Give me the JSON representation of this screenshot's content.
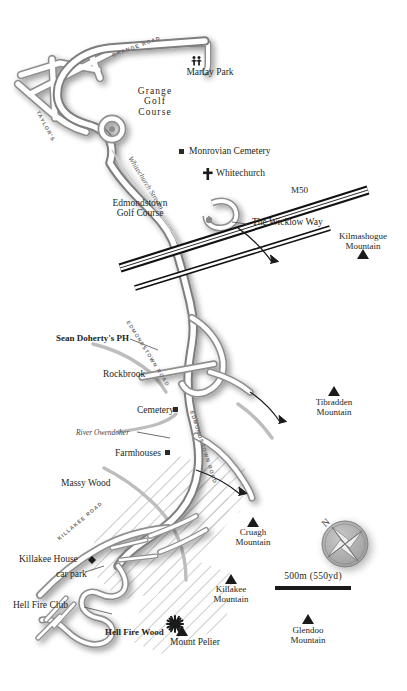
{
  "map": {
    "title": "Hell Fire Club / Dublin Mountains area map",
    "background_color": "#ffffff",
    "ink_color": "#231f20",
    "road_fill": "#ffffff",
    "road_casing": "#8a8a8a",
    "minor_road_color": "#b9b9b9",
    "motorway_color": "#111111"
  },
  "places": [
    {
      "name": "Marlay Park",
      "label": "Marlay Park",
      "x": 210,
      "y": 73,
      "align": "center",
      "style": "regular",
      "size": 9.5
    },
    {
      "name": "Grange Golf Course",
      "label_lines": [
        "Grange",
        "Golf",
        "Course"
      ],
      "x": 155,
      "y": 92,
      "align": "center",
      "style": "regular",
      "size": 9.5
    },
    {
      "name": "Monrovian Cemetery",
      "label": "Monrovian Cemetery",
      "x": 190,
      "y": 152,
      "align": "left",
      "style": "regular",
      "size": 9.5
    },
    {
      "name": "Whitechurch",
      "label": "Whitechurch",
      "x": 215,
      "y": 174,
      "align": "left",
      "style": "regular",
      "size": 9.5
    },
    {
      "name": "Whitechurch Stream",
      "label": "Whitechurch Stream",
      "x": 140,
      "y": 168,
      "align": "left",
      "style": "italic",
      "size": 7.5
    },
    {
      "name": "Edmondstown Golf Course",
      "label_lines": [
        "Edmondstown",
        "Golf Course"
      ],
      "x": 140,
      "y": 203,
      "align": "center",
      "style": "regular",
      "size": 9.5
    },
    {
      "name": "M50",
      "label": "M50",
      "x": 292,
      "y": 192,
      "align": "left",
      "style": "regular",
      "size": 9
    },
    {
      "name": "The Wicklow Way",
      "label": "The Wicklow Way",
      "x": 253,
      "y": 223,
      "align": "left",
      "style": "regular",
      "size": 9.5
    },
    {
      "name": "Kilmashogue Mountain",
      "label_lines": [
        "Kilmashogue",
        "Mountain"
      ],
      "x": 363,
      "y": 238,
      "align": "center",
      "style": "regular",
      "size": 9
    },
    {
      "name": "Sean Doherty's PH",
      "label": "Sean Doherty's PH",
      "x": 57,
      "y": 340,
      "align": "left",
      "style": "bold",
      "size": 9
    },
    {
      "name": "Rockbrook",
      "label": "Rockbrook",
      "x": 104,
      "y": 375,
      "align": "left",
      "style": "regular",
      "size": 9.5
    },
    {
      "name": "Cemetery",
      "label": "Cemetery",
      "x": 138,
      "y": 412,
      "align": "left",
      "style": "regular",
      "size": 9.5
    },
    {
      "name": "River Owendoher",
      "label": "River Owendoher",
      "x": 77,
      "y": 434,
      "align": "left",
      "style": "italic",
      "size": 7.5
    },
    {
      "name": "Farmhouses",
      "label": "Farmhouses",
      "x": 116,
      "y": 455,
      "align": "left",
      "style": "regular",
      "size": 9.5
    },
    {
      "name": "Massy Wood",
      "label": "Massy Wood",
      "x": 62,
      "y": 484,
      "align": "left",
      "style": "regular",
      "size": 9.5
    },
    {
      "name": "Tibradden Mountain",
      "label_lines": [
        "Tibradden",
        "Mountain"
      ],
      "x": 334,
      "y": 404,
      "align": "center",
      "style": "regular",
      "size": 9
    },
    {
      "name": "Cruagh Mountain",
      "label_lines": [
        "Cruagh",
        "Mountain"
      ],
      "x": 253,
      "y": 534,
      "align": "center",
      "style": "regular",
      "size": 9
    },
    {
      "name": "Killakee House",
      "label": "Killakee House",
      "x": 20,
      "y": 561,
      "align": "left",
      "style": "regular",
      "size": 9.5
    },
    {
      "name": "car park",
      "label": "car park",
      "x": 57,
      "y": 575,
      "align": "left",
      "style": "regular",
      "size": 9.5
    },
    {
      "name": "Killakee Mountain",
      "label_lines": [
        "Killakee",
        "Mountain"
      ],
      "x": 231,
      "y": 591,
      "align": "center",
      "style": "regular",
      "size": 9
    },
    {
      "name": "Hell Fire Club",
      "label": "Hell Fire Club",
      "x": 14,
      "y": 606,
      "align": "left",
      "style": "regular",
      "size": 9.5
    },
    {
      "name": "Hell Fire Wood",
      "label": "Hell Fire Wood",
      "x": 106,
      "y": 634,
      "align": "left",
      "style": "bold",
      "size": 9
    },
    {
      "name": "Mount Pelier",
      "label": "Mount Pelier",
      "x": 171,
      "y": 643,
      "align": "left",
      "style": "regular",
      "size": 9.5
    },
    {
      "name": "Glendoo Mountain",
      "label_lines": [
        "Glendoo",
        "Mountain"
      ],
      "x": 308,
      "y": 632,
      "align": "center",
      "style": "regular",
      "size": 9
    }
  ],
  "road_labels": [
    {
      "name": "grange-road",
      "text": "GRANGE ROAD",
      "x": 112,
      "y": 52,
      "rotate": -20
    },
    {
      "name": "taylors-lane",
      "text": "TAYLOR'S",
      "x": 38,
      "y": 108,
      "rotate": 62
    },
    {
      "name": "edmondstown-road-upper",
      "text": "EDMONDSTOWN ROAD",
      "x": 128,
      "y": 318,
      "rotate": 58
    },
    {
      "name": "edmondstown-road-lower",
      "text": "EDMONDSTOWN ROAD",
      "x": 192,
      "y": 408,
      "rotate": 72
    },
    {
      "name": "killakee-road",
      "text": "KILLAKEE ROAD",
      "x": 58,
      "y": 530,
      "rotate": 40
    }
  ],
  "markers": {
    "mountain_peaks": [
      {
        "name": "kilmashogue-peak",
        "x": 363,
        "y": 256
      },
      {
        "name": "tibradden-peak",
        "x": 334,
        "y": 393
      },
      {
        "name": "cruagh-peak",
        "x": 253,
        "y": 524
      },
      {
        "name": "killakee-peak",
        "x": 231,
        "y": 581
      },
      {
        "name": "glendoo-peak",
        "x": 308,
        "y": 621
      },
      {
        "name": "mount-pelier-peak",
        "x": 182,
        "y": 633
      }
    ],
    "squares": [
      {
        "name": "monrovian-cemetery-marker",
        "x": 182,
        "y": 152
      },
      {
        "name": "cemetery-marker",
        "x": 176,
        "y": 410
      },
      {
        "name": "farmhouses-marker",
        "x": 168,
        "y": 453
      }
    ],
    "church_cross": {
      "name": "whitechurch-cross",
      "x": 208,
      "y": 174
    },
    "sunburst": {
      "name": "mount-pelier-sunburst",
      "x": 175,
      "y": 624
    },
    "diamond": {
      "name": "killakee-house-marker",
      "x": 92,
      "y": 560
    },
    "pedestrians": {
      "name": "marlay-park-pedestrians",
      "x": 196,
      "y": 60
    }
  },
  "compass": {
    "name": "compass-rose",
    "north_label": "N",
    "x": 345,
    "y": 544
  },
  "scale_bar": {
    "label": "500m (550yd)",
    "x": 313,
    "y": 578,
    "width": 76
  }
}
